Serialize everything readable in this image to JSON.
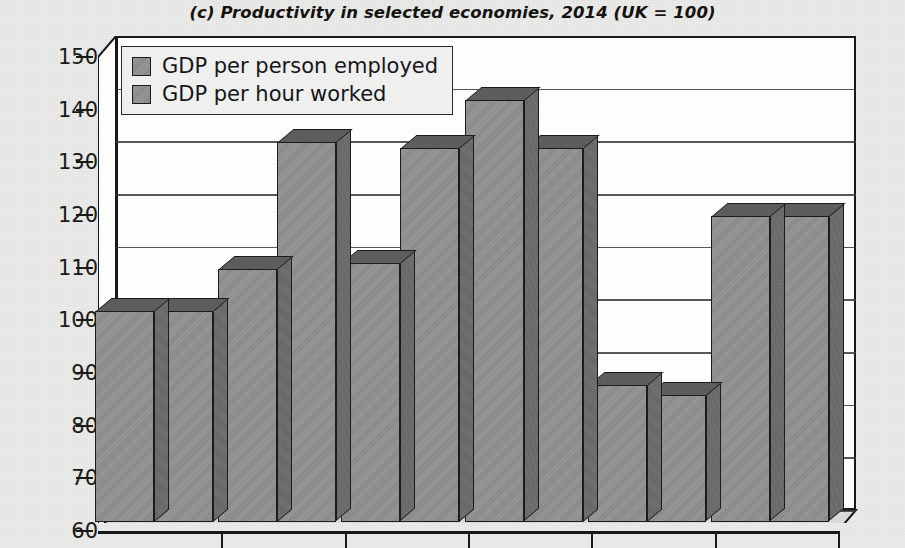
{
  "chart_data": {
    "type": "bar",
    "title": "(c) Productivity in selected economies, 2014 (UK = 100)",
    "xlabel": "",
    "ylabel": "",
    "ylim": [
      60,
      150
    ],
    "ytick_values": [
      150,
      140,
      130,
      120,
      110,
      100,
      90,
      80,
      70,
      60
    ],
    "ytick_labels": [
      "150",
      "140",
      "130",
      "120",
      "110",
      "100",
      "90",
      "80",
      "70",
      "60"
    ],
    "grid": true,
    "legend_position": "top-left",
    "categories": [
      "",
      "",
      "",
      "",
      "",
      ""
    ],
    "series": [
      {
        "name": "GDP per person employed",
        "values": [
          100,
          108,
          109,
          140,
          86,
          118
        ]
      },
      {
        "name": "GDP per hour worked",
        "values": [
          100,
          132,
          131,
          131,
          84,
          118
        ]
      }
    ],
    "style": "3d-clustered-column",
    "colors": {
      "bar_face": "#8d8d8d",
      "bar_top": "#5d5d5d",
      "bar_side": "#6a6a6a",
      "outline": "#1b1b1b",
      "plot_background": "#fdfdfc",
      "page_background": "#e9e9e7",
      "gridline": "#3a3a3a",
      "text": "#16161a"
    }
  },
  "legend": {
    "items": [
      {
        "label": "GDP per person employed",
        "swatch": "legend-swatch-gray"
      },
      {
        "label": "GDP per hour worked",
        "swatch": "legend-swatch-gray"
      }
    ]
  }
}
